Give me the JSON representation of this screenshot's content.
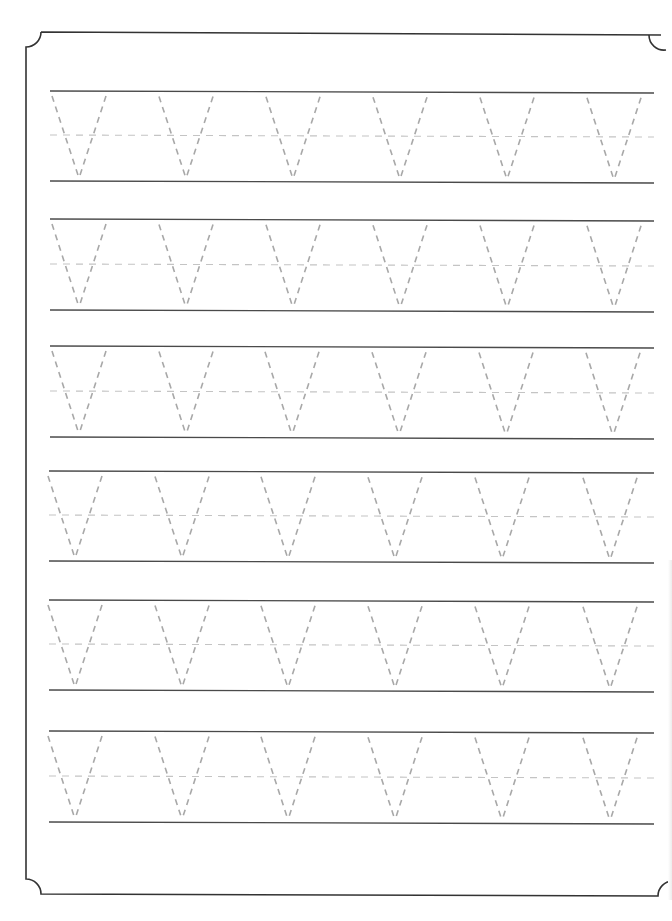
{
  "worksheet": {
    "title": "Letter V tracing practice",
    "letter": "V",
    "letters_per_row": 6,
    "row_count": 6,
    "colors": {
      "border": "#333333",
      "guide_line": "#4a4a4a",
      "midline_dashed": "#c4c4c4",
      "trace_letter": "#a8a8a8",
      "background": "#ffffff"
    },
    "border": {
      "left": 26,
      "top": 32,
      "bottom": 894,
      "right": 676,
      "corner_notch_radius": 15
    },
    "rows": [
      {
        "top": 91,
        "mid": 135,
        "bottom": 181,
        "x_start": 50,
        "x_end": 654,
        "apex_x": [
          79,
          186,
          293,
          400,
          507,
          614
        ]
      },
      {
        "top": 219,
        "mid": 264,
        "bottom": 310,
        "x_start": 50,
        "x_end": 654,
        "apex_x": [
          79,
          186,
          293,
          400,
          507,
          614
        ]
      },
      {
        "top": 346,
        "mid": 391,
        "bottom": 437,
        "x_start": 50,
        "x_end": 654,
        "apex_x": [
          79,
          186,
          292,
          399,
          506,
          613
        ]
      },
      {
        "top": 471,
        "mid": 515,
        "bottom": 561,
        "x_start": 49,
        "x_end": 654,
        "apex_x": [
          75,
          182,
          288,
          395,
          502,
          610
        ]
      },
      {
        "top": 600,
        "mid": 644,
        "bottom": 690,
        "x_start": 49,
        "x_end": 654,
        "apex_x": [
          75,
          182,
          288,
          395,
          502,
          610
        ]
      },
      {
        "top": 731,
        "mid": 776,
        "bottom": 822,
        "x_start": 49,
        "x_end": 654,
        "apex_x": [
          75,
          182,
          288,
          395,
          502,
          610
        ]
      }
    ]
  }
}
